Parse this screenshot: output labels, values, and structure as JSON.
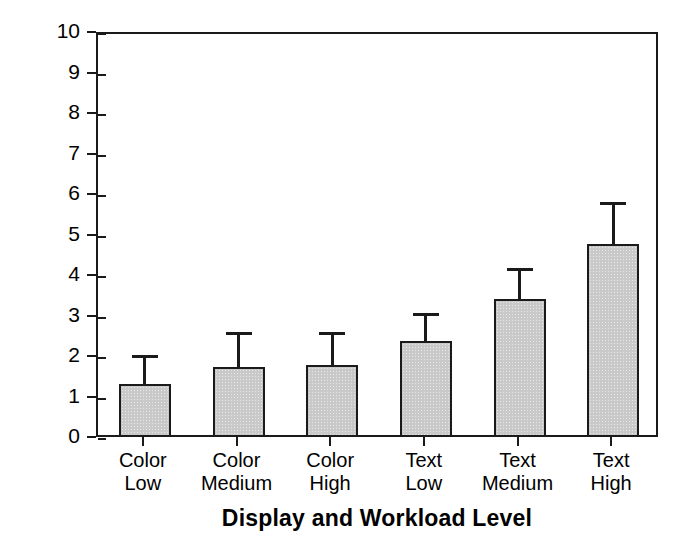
{
  "chart_data": {
    "type": "bar",
    "title": "",
    "xlabel": "Display and Workload Level",
    "ylabel": "Workload Rating",
    "categories": [
      "Color Low",
      "Color Medium",
      "Color High",
      "Text Low",
      "Text Medium",
      "Text High"
    ],
    "category_lines": [
      [
        "Color",
        "Low"
      ],
      [
        "Color",
        "Medium"
      ],
      [
        "Color",
        "High"
      ],
      [
        "Text",
        "Low"
      ],
      [
        "Text",
        "Medium"
      ],
      [
        "Text",
        "High"
      ]
    ],
    "values": [
      1.37,
      1.78,
      1.83,
      2.43,
      3.46,
      4.81
    ],
    "error_upper": [
      2.08,
      2.65,
      2.63,
      3.11,
      4.23,
      5.85
    ],
    "errorbars": "upper-only",
    "ylim": [
      0,
      10
    ],
    "ytick_labels": [
      "0",
      "1",
      "2",
      "3",
      "4",
      "5",
      "6",
      "7",
      "8",
      "9",
      "10"
    ],
    "ytick_values": [
      0,
      1,
      2,
      3,
      4,
      5,
      6,
      7,
      8,
      9,
      10
    ],
    "grid": false,
    "legend": null,
    "bar_fill_color": "#c9c9c9",
    "bar_edge_color": "#1a1a1a",
    "axis_color": "#1a1a1a",
    "background_color": "#ffffff"
  }
}
